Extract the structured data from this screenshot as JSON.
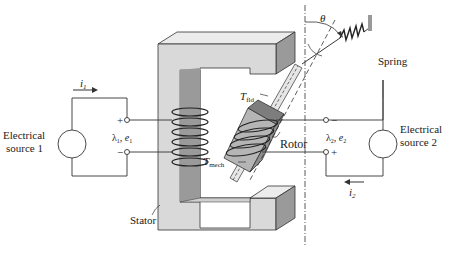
{
  "diagram": {
    "left_source": {
      "line1": "Electrical",
      "line2": "source 1"
    },
    "right_source": {
      "line1": "Electrical",
      "line2": "source 2"
    },
    "current1": "i",
    "current1_sub": "1",
    "current2": "i",
    "current2_sub": "2",
    "terminal1": {
      "plus": "+",
      "minus": "−",
      "lambda": "λ",
      "lambda_sub": "1",
      "e": ", e",
      "e_sub": "1"
    },
    "terminal2": {
      "plus": "+",
      "minus": "−",
      "lambda": "λ",
      "lambda_sub": "2",
      "e": ", e",
      "e_sub": "2"
    },
    "theta": "θ",
    "spring": "Spring",
    "rotor": "Rotor",
    "stator": "Stator",
    "t_fld": "T",
    "t_fld_sub": "fld",
    "t_mech": "T",
    "t_mech_sub": "mech"
  },
  "colors": {
    "core_front": "#d9d9d9",
    "core_top": "#ececec",
    "core_side": "#9a9a9a",
    "core_inner": "#8c8c8c",
    "line": "#333333",
    "rotor": "#b5b5b5",
    "rotor_dark": "#7d7d7d"
  }
}
